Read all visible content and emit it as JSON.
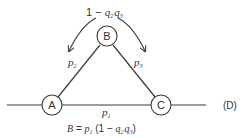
{
  "diagram": {
    "type": "network-reliability",
    "nodes": [
      {
        "id": "A",
        "label": "A"
      },
      {
        "id": "B",
        "label": "B"
      },
      {
        "id": "C",
        "label": "C"
      }
    ],
    "edges": [
      {
        "from": "A",
        "to": "C",
        "label_base": "p",
        "label_sub": "1"
      },
      {
        "from": "A",
        "to": "B",
        "label_base": "p",
        "label_sub": "2"
      },
      {
        "from": "B",
        "to": "C",
        "label_base": "p",
        "label_sub": "3"
      }
    ],
    "top_label": {
      "prefix": "1 − ",
      "q": "q",
      "sub1": "2",
      "sub2": "3"
    },
    "figure_tag": "(D)",
    "formula": {
      "lhs": "B",
      "eq": " = ",
      "p": "p",
      "p_sub": "1",
      "open": " (1 − ",
      "q": "q",
      "q_sub1": "2",
      "q_sub2": "3",
      "close": ")"
    },
    "colors": {
      "stroke": "#3a3a3a",
      "text": "#333333",
      "background": "#ffffff"
    }
  }
}
